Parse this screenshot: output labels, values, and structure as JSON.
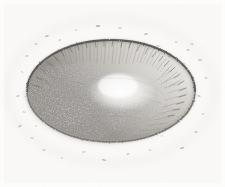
{
  "plate": {
    "kind": "antique-engraving",
    "subject": "lunar-crater",
    "title": "Lunar crater engraving",
    "description": "Monochrome stipple-and-line engraving of a large elliptical lunar crater seen obliquely, with a dark granular rim, radiating hatch lines descending the inner walls, a shaded lower-left interior and a bright central floor, surrounded by scattered small speck marks on the plain.",
    "width": 225,
    "height": 187
  },
  "colors": {
    "paper": "#fdfdfc",
    "paper_warm": "#faf9f6",
    "ink_dark": "#5d5a55",
    "ink_mid": "#8e8a84",
    "ink_light": "#bdb9b3",
    "shadow": "#9a9590",
    "highlight": "#fbfaf8",
    "rim_crest": "#6b6762"
  },
  "geometry": {
    "ellipse_cx": 111,
    "ellipse_cy": 91,
    "ellipse_rx": 84,
    "ellipse_ry": 51,
    "rim_top_y": 40,
    "rim_bottom_y": 142,
    "rim_left_x": 27,
    "rim_right_x": 195
  },
  "features": [
    {
      "name": "crater-rim",
      "label": "Crater rim"
    },
    {
      "name": "inner-wall-hatching",
      "label": "Radiating inner-wall hatching"
    },
    {
      "name": "crater-floor",
      "label": "Crater floor"
    },
    {
      "name": "shadow-zone",
      "label": "Shaded lower-left interior"
    },
    {
      "name": "central-highlight",
      "label": "Bright central floor highlight"
    },
    {
      "name": "surrounding-plain",
      "label": "Surrounding plain with speck marks"
    }
  ],
  "specks": [
    {
      "x": 47,
      "y": 36,
      "w": 4.0,
      "h": 1.6,
      "r": -22,
      "o": 0.45
    },
    {
      "x": 36,
      "y": 44,
      "w": 3.2,
      "h": 1.4,
      "r": 14,
      "o": 0.38
    },
    {
      "x": 27,
      "y": 56,
      "w": 3.6,
      "h": 1.5,
      "r": -8,
      "o": 0.34
    },
    {
      "x": 22,
      "y": 72,
      "w": 3.0,
      "h": 1.3,
      "r": 26,
      "o": 0.3
    },
    {
      "x": 18,
      "y": 96,
      "w": 3.4,
      "h": 1.5,
      "r": -16,
      "o": 0.36
    },
    {
      "x": 24,
      "y": 112,
      "w": 3.0,
      "h": 1.4,
      "r": 10,
      "o": 0.32
    },
    {
      "x": 20,
      "y": 126,
      "w": 4.2,
      "h": 1.6,
      "r": -30,
      "o": 0.4
    },
    {
      "x": 32,
      "y": 138,
      "w": 3.2,
      "h": 1.4,
      "r": 18,
      "o": 0.3
    },
    {
      "x": 44,
      "y": 150,
      "w": 3.6,
      "h": 1.5,
      "r": -12,
      "o": 0.34
    },
    {
      "x": 62,
      "y": 158,
      "w": 3.0,
      "h": 1.3,
      "r": 22,
      "o": 0.28
    },
    {
      "x": 84,
      "y": 152,
      "w": 3.8,
      "h": 1.5,
      "r": -6,
      "o": 0.33
    },
    {
      "x": 104,
      "y": 160,
      "w": 4.4,
      "h": 1.7,
      "r": 12,
      "o": 0.42
    },
    {
      "x": 128,
      "y": 154,
      "w": 3.2,
      "h": 1.4,
      "r": -20,
      "o": 0.3
    },
    {
      "x": 150,
      "y": 150,
      "w": 3.0,
      "h": 1.3,
      "r": 8,
      "o": 0.27
    },
    {
      "x": 182,
      "y": 148,
      "w": 4.6,
      "h": 1.7,
      "r": -14,
      "o": 0.44
    },
    {
      "x": 196,
      "y": 132,
      "w": 3.4,
      "h": 1.5,
      "r": 20,
      "o": 0.33
    },
    {
      "x": 203,
      "y": 114,
      "w": 3.0,
      "h": 1.3,
      "r": -10,
      "o": 0.29
    },
    {
      "x": 199,
      "y": 96,
      "w": 3.6,
      "h": 1.5,
      "r": 16,
      "o": 0.35
    },
    {
      "x": 206,
      "y": 78,
      "w": 3.2,
      "h": 1.4,
      "r": -24,
      "o": 0.31
    },
    {
      "x": 200,
      "y": 60,
      "w": 4.0,
      "h": 1.6,
      "r": 6,
      "o": 0.4
    },
    {
      "x": 188,
      "y": 50,
      "w": 3.4,
      "h": 1.5,
      "r": -18,
      "o": 0.36
    },
    {
      "x": 176,
      "y": 42,
      "w": 3.0,
      "h": 1.3,
      "r": 12,
      "o": 0.3
    },
    {
      "x": 170,
      "y": 56,
      "w": 3.8,
      "h": 1.5,
      "r": -28,
      "o": 0.38
    },
    {
      "x": 158,
      "y": 46,
      "w": 3.2,
      "h": 1.4,
      "r": 20,
      "o": 0.32
    },
    {
      "x": 184,
      "y": 64,
      "w": 3.0,
      "h": 1.3,
      "r": -4,
      "o": 0.28
    },
    {
      "x": 192,
      "y": 44,
      "w": 3.4,
      "h": 1.5,
      "r": 24,
      "o": 0.34
    },
    {
      "x": 146,
      "y": 34,
      "w": 4.2,
      "h": 1.6,
      "r": -16,
      "o": 0.41
    },
    {
      "x": 120,
      "y": 28,
      "w": 3.6,
      "h": 1.5,
      "r": 10,
      "o": 0.37
    },
    {
      "x": 98,
      "y": 26,
      "w": 4.8,
      "h": 1.8,
      "r": -8,
      "o": 0.46
    },
    {
      "x": 76,
      "y": 30,
      "w": 3.0,
      "h": 1.3,
      "r": 18,
      "o": 0.29
    },
    {
      "x": 60,
      "y": 40,
      "w": 3.2,
      "h": 1.4,
      "r": -22,
      "o": 0.31
    },
    {
      "x": 40,
      "y": 62,
      "w": 2.8,
      "h": 1.2,
      "r": 14,
      "o": 0.26
    },
    {
      "x": 168,
      "y": 70,
      "w": 2.8,
      "h": 1.2,
      "r": -12,
      "o": 0.25
    },
    {
      "x": 36,
      "y": 126,
      "w": 2.8,
      "h": 1.2,
      "r": 8,
      "o": 0.24
    },
    {
      "x": 162,
      "y": 136,
      "w": 2.6,
      "h": 1.2,
      "r": -18,
      "o": 0.23
    }
  ]
}
